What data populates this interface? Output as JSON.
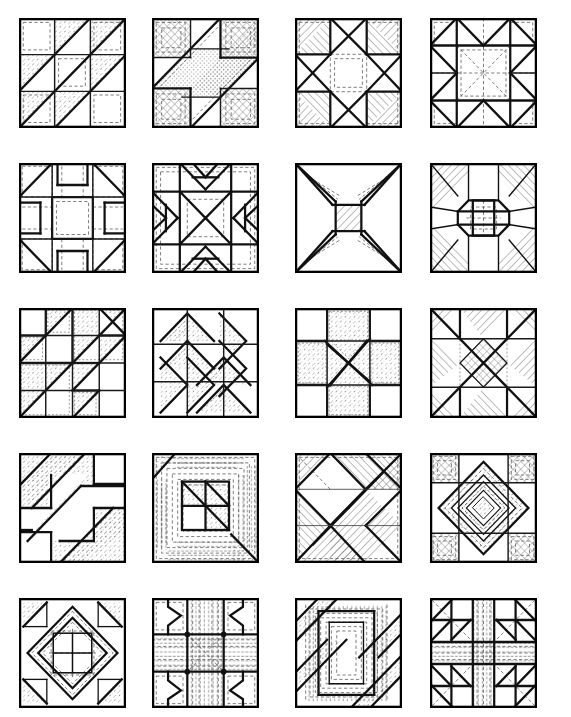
{
  "page": {
    "background_color": "#ffffff",
    "ink_color": "#111111",
    "rows": 5,
    "columns": 4,
    "block_count": 20,
    "width_px": 571,
    "height_px": 717
  },
  "layout": {
    "column_x": [
      19,
      152,
      295,
      430
    ],
    "row_y": [
      18,
      163,
      308,
      453,
      598
    ],
    "block_width": 107,
    "block_height": 110
  },
  "textures": {
    "hatch_a": "diagonal-hatch-45",
    "hatch_b": "diagonal-hatch-135",
    "stipple": "stipple-dots",
    "dotty": "fine-dots",
    "crosshatch": "crosshatch",
    "vertical": "vertical-lines",
    "horizontal": "horizontal-lines",
    "plain": "unfilled-white"
  },
  "blocks": [
    {
      "index": 1,
      "row": 1,
      "column": 1,
      "name": "half-square-triangle-grid",
      "grid": "3x3",
      "description": "Nine-patch of half square triangles with shaded lower-left halves forming a diagonal chain."
    },
    {
      "index": 2,
      "row": 1,
      "column": 2,
      "name": "diagonal-ribbon-bars",
      "grid": "3x3",
      "description": "Wide diagonal ribbon sweeping corner to corner with textured corner squares."
    },
    {
      "index": 3,
      "row": 1,
      "column": 3,
      "name": "eight-point-star-in-square",
      "grid": "3x3",
      "description": "Eight pointed star built from quarter square triangles with hatched corner squares."
    },
    {
      "index": 4,
      "row": 1,
      "column": 4,
      "name": "double-x-star",
      "grid": "4x4",
      "description": "Interlocking triangle star with dashed inner square and plain corners."
    },
    {
      "index": 5,
      "row": 2,
      "column": 1,
      "name": "cross-and-corner-triangles",
      "grid": "4x4",
      "description": "Central open square framed by narrow bars with large corner triangles."
    },
    {
      "index": 6,
      "row": 2,
      "column": 2,
      "name": "sawtooth-chevron-star",
      "grid": "4x4",
      "description": "Radiating chevrons around a central pinwheel with concentric dashed border."
    },
    {
      "index": 7,
      "row": 2,
      "column": 3,
      "name": "four-point-hourglass-star",
      "grid": "1x1",
      "description": "Concave four point star on a heavily hatched field."
    },
    {
      "index": 8,
      "row": 2,
      "column": 4,
      "name": "octagon-medallion",
      "grid": "3x3",
      "description": "Central octagon medallion with radiating kite shapes and shaded corners."
    },
    {
      "index": 9,
      "row": 3,
      "column": 1,
      "name": "stepped-triangle-chain",
      "grid": "4x4",
      "description": "Chain of stippled triangles stepping diagonally across the block."
    },
    {
      "index": 10,
      "row": 3,
      "column": 2,
      "name": "rotating-dart-pinwheel",
      "grid": "3x3",
      "description": "Four rotating dart groups around a centre forming a pinwheel."
    },
    {
      "index": 11,
      "row": 3,
      "column": 3,
      "name": "card-trick-pinwheel",
      "grid": "3x3",
      "description": "Overlapping parallelogram blades spinning from the block centre."
    },
    {
      "index": 12,
      "row": 3,
      "column": 4,
      "name": "x-cross-with-diamond-centre",
      "grid": "3x3",
      "description": "Large X of hatched triangles with a cross hatched diamond at the centre."
    },
    {
      "index": 13,
      "row": 4,
      "column": 1,
      "name": "diagonal-stripe-with-corner-squares",
      "grid": "3x3",
      "description": "Broad stippled diagonal stripes broken by two plain corner squares."
    },
    {
      "index": 14,
      "row": 4,
      "column": 2,
      "name": "log-cabin-courthouse-steps",
      "grid": "nested",
      "description": "Nested rectangular log cabin rounds with hatched corner and centre units."
    },
    {
      "index": 15,
      "row": 4,
      "column": 3,
      "name": "on-point-square-lattice",
      "grid": "diagonal",
      "description": "Diagonal lattice of on point squares with alternating hatch directions."
    },
    {
      "index": 16,
      "row": 4,
      "column": 4,
      "name": "concentric-diamond-medallion",
      "grid": "3x3",
      "description": "Concentric on point diamonds nested inside a square with textured corners."
    },
    {
      "index": 17,
      "row": 5,
      "column": 1,
      "name": "octagon-ring-with-corner-triangles",
      "grid": "3x3",
      "description": "Octagonal ring around a four patch centre with triangle filled corners."
    },
    {
      "index": 18,
      "row": 5,
      "column": 2,
      "name": "bowtie-chevron-nine-patch",
      "grid": "3x3",
      "description": "Nine patch of chevron notched units framing a dashed centre."
    },
    {
      "index": 19,
      "row": 5,
      "column": 3,
      "name": "attic-window-spiral",
      "grid": "spiral",
      "description": "Spiralling nested frames with diagonal corner bands."
    },
    {
      "index": 20,
      "row": 5,
      "column": 4,
      "name": "cross-with-triangle-corners",
      "grid": "3x3",
      "description": "Striped cross through the centre with triangle filled corner blocks."
    }
  ]
}
